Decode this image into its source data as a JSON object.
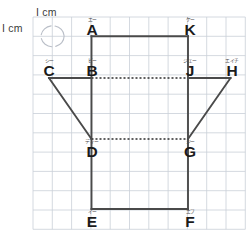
{
  "figure": {
    "name": "grid-geometry-figure",
    "grid": {
      "cell_px": 19.3,
      "left": 33,
      "top": 17,
      "cols": 11,
      "rows": 11,
      "line_color": "#c9cfd8",
      "show_grid": true
    },
    "scale_notes": [
      {
        "id": "scale-top",
        "text": "I cm",
        "x": 36,
        "y": 6
      },
      {
        "id": "scale-left",
        "text": "I cm",
        "x": 2,
        "y": 22
      }
    ],
    "unit_cell_highlight": {
      "cx": 52.6,
      "cy": 36.3,
      "rx": 11.5,
      "ry": 10.5,
      "color": "#b9bec7"
    },
    "shape": {
      "outline_color": "#4a4a4a",
      "outline_width": 1.9,
      "dashed_color": "#2c2c2c",
      "dashed_width": 1.5,
      "dash_pattern": "2,2"
    },
    "vertices": [
      {
        "id": "A",
        "label": "A",
        "ruby": "エー",
        "x": 91.5,
        "y": 36.3,
        "lx": 84,
        "ly": 17
      },
      {
        "id": "K",
        "label": "K",
        "ruby": "ケー",
        "x": 188.0,
        "y": 36.3,
        "lx": 182,
        "ly": 17
      },
      {
        "id": "C",
        "label": "C",
        "ruby": "シー",
        "x": 49.0,
        "y": 78.0,
        "lx": 41,
        "ly": 58
      },
      {
        "id": "B",
        "label": "B",
        "ruby": "ビー",
        "x": 91.5,
        "y": 78.0,
        "lx": 84,
        "ly": 58
      },
      {
        "id": "J",
        "label": "J",
        "ruby": "ジェー",
        "x": 188.0,
        "y": 78.0,
        "lx": 182,
        "ly": 58
      },
      {
        "id": "H",
        "label": "H",
        "ruby": "エイチ",
        "x": 230.5,
        "y": 78.0,
        "lx": 224,
        "ly": 58
      },
      {
        "id": "D",
        "label": "D",
        "ruby": "ディー",
        "x": 91.5,
        "y": 139.0,
        "lx": 84,
        "ly": 139
      },
      {
        "id": "G",
        "label": "G",
        "ruby": "ジー",
        "x": 188.0,
        "y": 139.0,
        "lx": 182,
        "ly": 139
      },
      {
        "id": "E",
        "label": "E",
        "ruby": "イー",
        "x": 91.5,
        "y": 209.0,
        "lx": 84,
        "ly": 209
      },
      {
        "id": "F",
        "label": "F",
        "ruby": "エフ",
        "x": 188.0,
        "y": 209.0,
        "lx": 182,
        "ly": 209
      }
    ],
    "solid_edges": [
      {
        "id": "edge-A-K",
        "from": "A",
        "to": "K"
      },
      {
        "id": "edge-A-B",
        "from": "A",
        "to": "B"
      },
      {
        "id": "edge-K-J",
        "from": "K",
        "to": "J"
      },
      {
        "id": "edge-C-B",
        "from": "C",
        "to": "B"
      },
      {
        "id": "edge-J-H",
        "from": "J",
        "to": "H"
      },
      {
        "id": "edge-C-D",
        "from": "C",
        "to": "D"
      },
      {
        "id": "edge-H-G",
        "from": "H",
        "to": "G"
      },
      {
        "id": "edge-B-D",
        "from": "B",
        "to": "D"
      },
      {
        "id": "edge-J-G",
        "from": "J",
        "to": "G"
      },
      {
        "id": "edge-D-E",
        "from": "D",
        "to": "E"
      },
      {
        "id": "edge-G-F",
        "from": "G",
        "to": "F"
      },
      {
        "id": "edge-E-F",
        "from": "E",
        "to": "F"
      }
    ],
    "dashed_edges": [
      {
        "id": "dashed-B-J",
        "from": "B",
        "to": "J"
      },
      {
        "id": "dashed-D-G",
        "from": "D",
        "to": "G"
      }
    ]
  }
}
